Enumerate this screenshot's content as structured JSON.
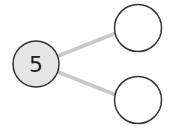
{
  "diagram": {
    "type": "number-bond",
    "whole": {
      "label": "5",
      "fill": "#e5e5e5"
    },
    "parts": [
      {
        "label": "",
        "fill": "#ffffff"
      },
      {
        "label": "",
        "fill": "#ffffff"
      }
    ],
    "colors": {
      "stroke": "#333333",
      "connector": "#c8c8c8"
    }
  }
}
